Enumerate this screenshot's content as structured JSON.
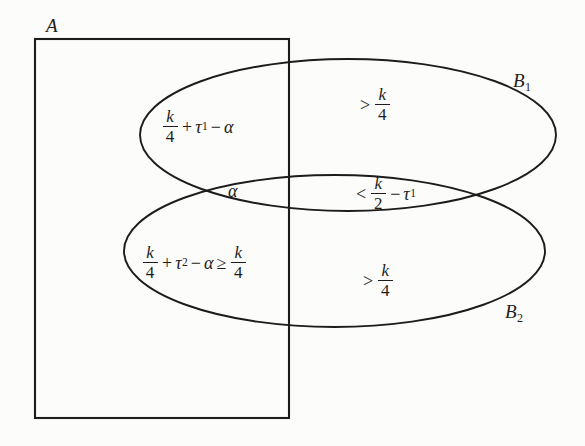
{
  "figure": {
    "type": "venn-diagram",
    "background_color": "#fcfcfa",
    "stroke_color": "#1c1c1c",
    "sets": {
      "rectangle_label": "A",
      "ellipse_top_label": "B",
      "ellipse_top_subscript": "1",
      "ellipse_bottom_label": "B",
      "ellipse_bottom_subscript": "2"
    },
    "regions": {
      "top_left": {
        "name": "A-intersect-B1-only",
        "num1": "k",
        "den1": "4",
        "op1": "+",
        "tau": "τ",
        "tau_sub": "1",
        "op2": "−",
        "alpha": "α"
      },
      "top_right": {
        "name": "B1-only",
        "rel": ">",
        "num1": "k",
        "den1": "4"
      },
      "middle_left": {
        "name": "A-intersect-B1-intersect-B2",
        "alpha": "α"
      },
      "middle_right": {
        "name": "B1-intersect-B2-outside-A",
        "rel": "<",
        "num1": "k",
        "den1": "2",
        "op1": "−",
        "tau": "τ",
        "tau_sub": "1"
      },
      "bottom_left": {
        "name": "A-intersect-B2-only",
        "num1": "k",
        "den1": "4",
        "op1": "+",
        "tau": "τ",
        "tau_sub": "2",
        "op2": "−",
        "alpha": "α",
        "rel2": "≥",
        "num2": "k",
        "den2": "4"
      },
      "bottom_right": {
        "name": "B2-only",
        "rel": ">",
        "num1": "k",
        "den1": "4"
      }
    }
  }
}
